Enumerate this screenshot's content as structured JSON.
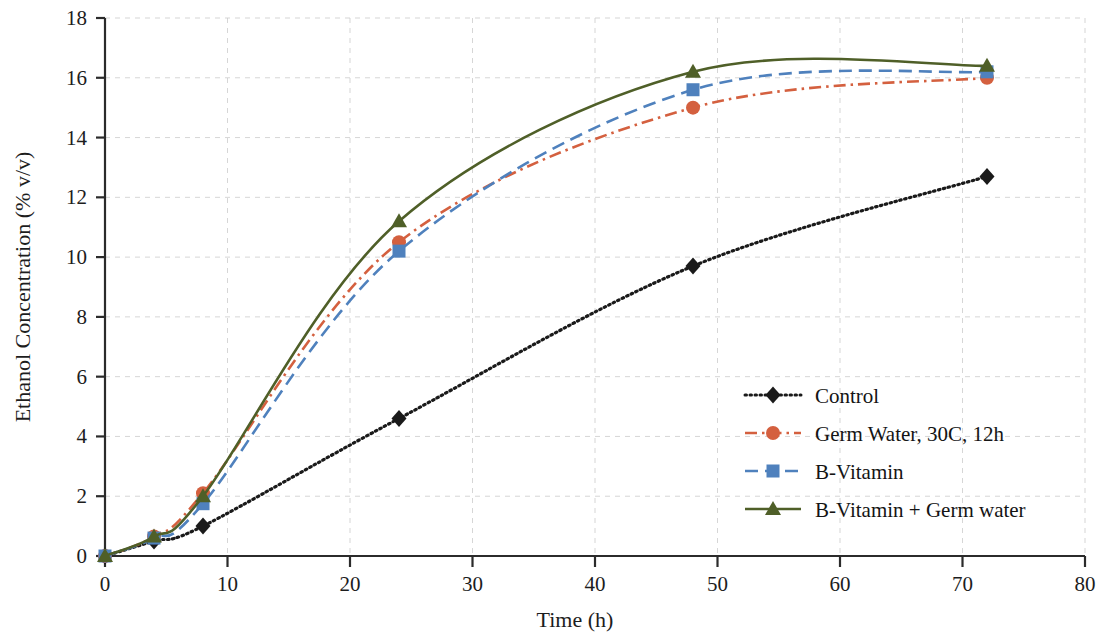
{
  "chart_data": {
    "type": "line",
    "title": "",
    "xlabel": "Time (h)",
    "ylabel": "Ethanol Concentration (% v/v)",
    "xlim": [
      0,
      80
    ],
    "ylim": [
      0,
      18
    ],
    "xticks": [
      0,
      10,
      20,
      30,
      40,
      50,
      60,
      70,
      80
    ],
    "yticks": [
      0,
      2,
      4,
      6,
      8,
      10,
      12,
      14,
      16,
      18
    ],
    "grid": true,
    "legend_position": "center-right",
    "x": [
      0,
      4,
      8,
      24,
      48,
      72
    ],
    "series": [
      {
        "name": "Control",
        "color": "#1a1a1a",
        "marker": "diamond",
        "linestyle": "dotted",
        "values": [
          0,
          0.5,
          1.0,
          4.6,
          9.7,
          12.7
        ]
      },
      {
        "name": "Germ Water, 30C, 12h",
        "color": "#d4603f",
        "marker": "circle",
        "linestyle": "dash-dot",
        "values": [
          0,
          0.65,
          2.1,
          10.5,
          15.0,
          16.0
        ]
      },
      {
        "name": "B-Vitamin",
        "color": "#4f81bd",
        "marker": "square",
        "linestyle": "dashed",
        "values": [
          0,
          0.6,
          1.75,
          10.2,
          15.6,
          16.2
        ]
      },
      {
        "name": "B-Vitamin + Germ water",
        "color": "#4f5f28",
        "marker": "triangle",
        "linestyle": "solid",
        "values": [
          0,
          0.65,
          2.0,
          11.2,
          16.2,
          16.4
        ]
      }
    ]
  },
  "axes": {
    "x_tick_labels": [
      "0",
      "10",
      "20",
      "30",
      "40",
      "50",
      "60",
      "70",
      "80"
    ],
    "y_tick_labels": [
      "0",
      "2",
      "4",
      "6",
      "8",
      "10",
      "12",
      "14",
      "16",
      "18"
    ],
    "x_axis_title": "Time (h)",
    "y_axis_title": "Ethanol Concentration (% v/v)"
  },
  "legend": {
    "items": [
      {
        "label": "Control"
      },
      {
        "label": "Germ Water, 30C, 12h"
      },
      {
        "label": "B-Vitamin"
      },
      {
        "label": "B-Vitamin + Germ water"
      }
    ]
  }
}
